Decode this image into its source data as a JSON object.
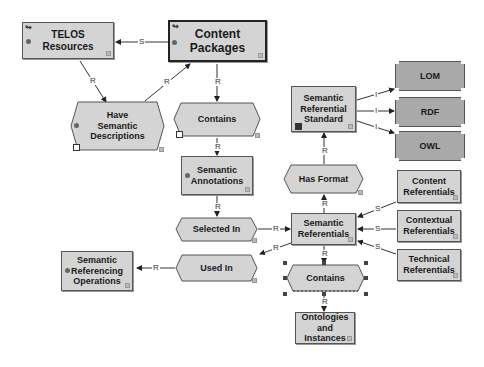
{
  "diagram": {
    "nodes": {
      "telos_resources": {
        "label": "TELOS\nResources",
        "shape": "rect"
      },
      "content_packages": {
        "label": "Content\nPackages",
        "shape": "rect-thick"
      },
      "have_semantic_descriptions": {
        "label": "Have\nSemantic\nDescriptions",
        "shape": "hexagon"
      },
      "contains_top": {
        "label": "Contains",
        "shape": "hexagon"
      },
      "semantic_annotations": {
        "label": "Semantic\nAnnotations",
        "shape": "rect"
      },
      "selected_in": {
        "label": "Selected In",
        "shape": "hexagon"
      },
      "used_in": {
        "label": "Used In",
        "shape": "hexagon"
      },
      "semantic_referencing_operations": {
        "label": "Semantic\nReferencing\nOperations",
        "shape": "rect"
      },
      "semantic_referential_standard": {
        "label": "Semantic\nReferential\nStandard",
        "shape": "rect"
      },
      "lom": {
        "label": "LOM",
        "shape": "notched-rect"
      },
      "rdf": {
        "label": "RDF",
        "shape": "notched-rect"
      },
      "owl": {
        "label": "OWL",
        "shape": "notched-rect"
      },
      "has_format": {
        "label": "Has Format",
        "shape": "hexagon"
      },
      "semantic_referentials": {
        "label": "Semantic\nReferentials",
        "shape": "rect"
      },
      "content_referentials": {
        "label": "Content\nReferentials",
        "shape": "rect"
      },
      "contextual_referentials": {
        "label": "Contextual\nReferentials",
        "shape": "rect"
      },
      "technical_referentials": {
        "label": "Technical\nReferentials",
        "shape": "rect"
      },
      "contains_bottom": {
        "label": "Contains",
        "shape": "hexagon",
        "selected": true
      },
      "ontologies_and_instances": {
        "label": "Ontologies and\nInstances",
        "shape": "rect"
      }
    },
    "edge_labels": {
      "s": "S",
      "r": "R",
      "i": "I"
    },
    "edges": [
      {
        "from": "content_packages",
        "to": "telos_resources",
        "label": "S"
      },
      {
        "from": "telos_resources",
        "to": "have_semantic_descriptions",
        "label": "R"
      },
      {
        "from": "have_semantic_descriptions",
        "to": "content_packages",
        "label": "R"
      },
      {
        "from": "content_packages",
        "to": "contains_top",
        "label": "R"
      },
      {
        "from": "contains_top",
        "to": "semantic_annotations",
        "label": "R"
      },
      {
        "from": "semantic_annotations",
        "to": "selected_in",
        "label": "R"
      },
      {
        "from": "selected_in",
        "to": "semantic_referentials",
        "label": "R"
      },
      {
        "from": "semantic_referentials",
        "to": "used_in",
        "label": "R"
      },
      {
        "from": "used_in",
        "to": "semantic_referencing_operations",
        "label": "R"
      },
      {
        "from": "semantic_referentials",
        "to": "has_format",
        "label": "R"
      },
      {
        "from": "has_format",
        "to": "semantic_referential_standard",
        "label": "R"
      },
      {
        "from": "semantic_referential_standard",
        "to": "lom",
        "label": "I"
      },
      {
        "from": "semantic_referential_standard",
        "to": "rdf",
        "label": "I"
      },
      {
        "from": "semantic_referential_standard",
        "to": "owl",
        "label": "I"
      },
      {
        "from": "content_referentials",
        "to": "semantic_referentials",
        "label": "S"
      },
      {
        "from": "contextual_referentials",
        "to": "semantic_referentials",
        "label": "S"
      },
      {
        "from": "technical_referentials",
        "to": "semantic_referentials",
        "label": "S"
      },
      {
        "from": "semantic_referentials",
        "to": "contains_bottom",
        "label": "R"
      },
      {
        "from": "contains_bottom",
        "to": "ontologies_and_instances",
        "label": "R"
      }
    ],
    "colors": {
      "node_fill": "#d4d4d4",
      "dark_node_fill": "#a9a9a9",
      "border": "#555555",
      "edge": "#333333"
    }
  }
}
